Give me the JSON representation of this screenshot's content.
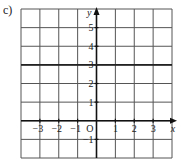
{
  "figure": {
    "part_label": "c)",
    "axis_labels": {
      "x": "x",
      "y": "y"
    },
    "origin_label": "O",
    "x_tick_labels": [
      "−3",
      "−2",
      "−1",
      "1",
      "2",
      "3"
    ],
    "y_tick_labels": [
      "5",
      "4",
      "3",
      "2",
      "1",
      "−1"
    ],
    "colors": {
      "grid": "#555555",
      "axis": "#111111",
      "line": "#222222",
      "text": "#222222"
    }
  },
  "chart_data": {
    "type": "line",
    "title": "",
    "xlabel": "x",
    "ylabel": "y",
    "xlim": [
      -4,
      4
    ],
    "ylim": [
      -2,
      6
    ],
    "grid": true,
    "x_ticks": [
      -3,
      -2,
      -1,
      1,
      2,
      3
    ],
    "y_ticks": [
      -1,
      1,
      2,
      3,
      4,
      5
    ],
    "series": [
      {
        "name": "y = 3",
        "x": [
          -4,
          4
        ],
        "y": [
          3,
          3
        ]
      }
    ],
    "annotations": [
      "O"
    ]
  }
}
